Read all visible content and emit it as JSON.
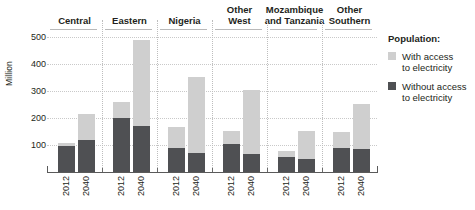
{
  "chart_data": {
    "type": "bar",
    "stacked": true,
    "title": "",
    "xlabel": "",
    "ylabel": "Million",
    "ylim": [
      0,
      500
    ],
    "yticks": [
      100,
      200,
      300,
      400,
      500
    ],
    "grid": true,
    "legend_position": "right",
    "legend_title": "Population:",
    "series": [
      {
        "name": "With access to electricity",
        "color": "#cfcfcf",
        "values": [
          13,
          97,
          58,
          320,
          75,
          280,
          47,
          237,
          23,
          104,
          60,
          167
        ]
      },
      {
        "name": "Without access to electricity",
        "color": "#4f5053",
        "values": [
          95,
          118,
          200,
          170,
          90,
          72,
          105,
          65,
          55,
          48,
          88,
          85
        ]
      }
    ],
    "totals": [
      108,
      215,
      258,
      490,
      165,
      352,
      152,
      302,
      78,
      152,
      148,
      252
    ],
    "categories": [
      "2012",
      "2040",
      "2012",
      "2040",
      "2012",
      "2040",
      "2012",
      "2040",
      "2012",
      "2040",
      "2012",
      "2040"
    ],
    "groups": [
      {
        "label": "Central",
        "label_lines": [
          "Central"
        ],
        "ticks": [
          "2012",
          "2040"
        ]
      },
      {
        "label": "Eastern",
        "label_lines": [
          "Eastern"
        ],
        "ticks": [
          "2012",
          "2040"
        ]
      },
      {
        "label": "Nigeria",
        "label_lines": [
          "Nigeria"
        ],
        "ticks": [
          "2012",
          "2040"
        ]
      },
      {
        "label": "Other West",
        "label_lines": [
          "Other",
          "West"
        ],
        "ticks": [
          "2012",
          "2040"
        ]
      },
      {
        "label": "Mozambique and Tanzania",
        "label_lines": [
          "Mozambique",
          "and Tanzania"
        ],
        "ticks": [
          "2012",
          "2040"
        ]
      },
      {
        "label": "Other Southern",
        "label_lines": [
          "Other",
          "Southern"
        ],
        "ticks": [
          "2012",
          "2040"
        ]
      }
    ]
  },
  "legend": {
    "title": "Population:",
    "items": [
      {
        "label_lines": [
          "With access",
          "to electricity"
        ],
        "color": "#cfcfcf"
      },
      {
        "label_lines": [
          "Without access",
          "to electricity"
        ],
        "color": "#4f5053"
      }
    ]
  },
  "axis": {
    "y_title": "Million",
    "y_ticks": [
      "500",
      "400",
      "300",
      "200",
      "100"
    ]
  }
}
